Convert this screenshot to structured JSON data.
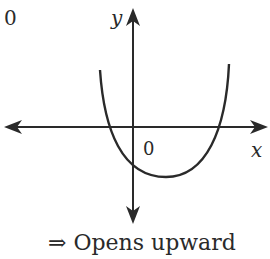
{
  "figure": {
    "corner_label": "0",
    "axes": {
      "x_label": "x",
      "y_label": "y",
      "origin_label": "0"
    },
    "curve": {
      "type": "parabola",
      "direction": "upward",
      "vertex_position": "below x-axis, right of y-axis",
      "x_intercepts": "one negative, one positive",
      "y_intercept": "negative"
    },
    "conclusion": "⇒  Opens upward",
    "colors": {
      "stroke": "#2a2a2a",
      "background": "#ffffff"
    }
  }
}
